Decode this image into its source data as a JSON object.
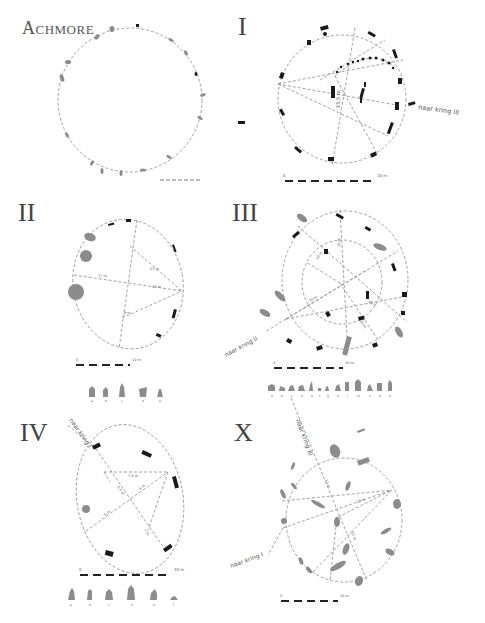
{
  "site": {
    "title": "Achmore"
  },
  "panels": [
    {
      "id": "achmore",
      "title": "Achmore"
    },
    {
      "id": "I",
      "title": "I",
      "direction_label": "naar kring III",
      "measure": "15,5 m",
      "scale": {
        "start": "0",
        "end": "10 m"
      }
    },
    {
      "id": "II",
      "title": "II",
      "measures": [
        "17 m",
        "13 m",
        "11 m",
        "9 m"
      ],
      "scale": {
        "start": "0",
        "end": "10 m"
      },
      "stone_profiles": [
        "a",
        "b",
        "c",
        "d",
        "e"
      ]
    },
    {
      "id": "III",
      "title": "III",
      "direction_label": "naar kring II",
      "measures": [
        "10 m",
        "10 m",
        "10 m",
        "10 m",
        "10 m"
      ],
      "scale": {
        "start": "0",
        "end": "10 m"
      },
      "stone_profiles": [
        "a",
        "b",
        "c",
        "d",
        "e",
        "f",
        "g",
        "h",
        "i",
        "j",
        "m",
        "n",
        "p",
        "q"
      ]
    },
    {
      "id": "IV",
      "title": "IV",
      "direction_label": "naar kring I",
      "measures": [
        "7,6 m",
        "6,5 m",
        "6 m",
        "5 m",
        "7 m"
      ],
      "scale": {
        "start": "0",
        "end": "10 m"
      },
      "stone_profiles": [
        "a",
        "b",
        "c",
        "d",
        "e",
        "f"
      ]
    },
    {
      "id": "X",
      "title": "X",
      "direction_labels": [
        "naar kring XI",
        "naar kring I"
      ],
      "measures": [
        "13 m",
        "13 m",
        "13 m"
      ],
      "scale": {
        "start": "0",
        "end": "10 m"
      }
    }
  ],
  "colors": {
    "stone_dark": "#1a1a1a",
    "stone_grey": "#8c8c8c",
    "dashed_line": "#8a8a8a",
    "text": "#444444"
  }
}
